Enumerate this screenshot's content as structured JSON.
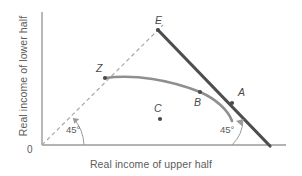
{
  "figure": {
    "axes": {
      "x_title": "Real income of upper half",
      "y_title": "Real income of lower half",
      "origin_label": "0",
      "x_axis_from": [
        42,
        145
      ],
      "x_axis_to": [
        286,
        145
      ],
      "y_axis_from": [
        42,
        145
      ],
      "y_axis_to": [
        42,
        12
      ]
    },
    "colors": {
      "axis": "#9a9a9a",
      "dashed_line": "#a8a8a8",
      "thick_line": "#4e4e4e",
      "curve": "#8f8f8f",
      "text": "#5c5c5c",
      "point_label": "#4a4a4a",
      "background": "#ffffff"
    },
    "points": [
      {
        "id": "E",
        "label": "E",
        "x": 158,
        "y": 30,
        "label_x": 155,
        "label_y": 14,
        "marker": true
      },
      {
        "id": "Z",
        "label": "Z",
        "x": 105,
        "y": 78,
        "label_x": 96,
        "label_y": 62,
        "marker": true
      },
      {
        "id": "A",
        "label": "A",
        "x": 232,
        "y": 103,
        "label_x": 238,
        "label_y": 86,
        "marker": true
      },
      {
        "id": "B",
        "label": "B",
        "x": 200,
        "y": 92,
        "label_x": 194,
        "label_y": 96,
        "marker": true
      },
      {
        "id": "C",
        "label": "C",
        "x": 160,
        "y": 119,
        "label_x": 154,
        "label_y": 102,
        "marker": true
      }
    ],
    "angles": [
      {
        "id": "left-45",
        "label": "45°",
        "label_x": 66,
        "label_y": 124,
        "vertex_x": 42,
        "vertex_y": 145
      },
      {
        "id": "right-45",
        "label": "45°",
        "label_x": 220,
        "label_y": 124,
        "vertex_x": 268,
        "vertex_y": 145
      }
    ],
    "dashed_ray": {
      "from": [
        42,
        145
      ],
      "to": [
        163,
        25
      ]
    },
    "thick_line": {
      "from": [
        158,
        30
      ],
      "to": [
        270,
        146
      ]
    },
    "curve_path": "M 105 78 C 135 74, 170 80, 200 92 C 216 99, 228 110, 232 121",
    "curve_label": "income-possibility-frontier"
  }
}
